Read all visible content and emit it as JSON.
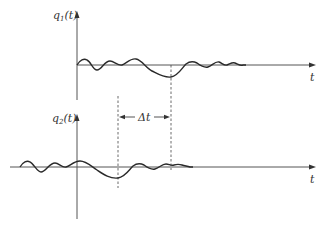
{
  "diagram": {
    "top_plot": {
      "y_label": "q",
      "y_label_sub": "1",
      "y_label_arg": "(t)",
      "x_label": "t"
    },
    "bottom_plot": {
      "y_label": "q",
      "y_label_sub": "2",
      "y_label_arg": "(t)",
      "x_label": "t"
    },
    "delay_label": "Δt",
    "colors": {
      "curve": "#2a2a2a",
      "axis": "#555555",
      "background": "#ffffff"
    }
  }
}
